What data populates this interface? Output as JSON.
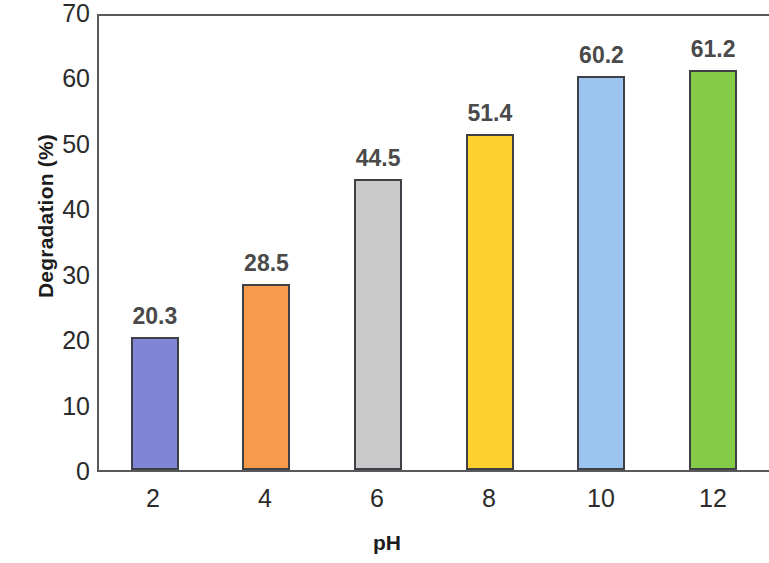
{
  "chart_data": {
    "type": "bar",
    "title": "",
    "xlabel": "pH",
    "ylabel": "Degradation (%)",
    "categories": [
      "2",
      "4",
      "6",
      "8",
      "10",
      "12"
    ],
    "values": [
      20.3,
      28.5,
      44.5,
      51.4,
      60.2,
      61.2
    ],
    "value_labels": [
      "20.3",
      "28.5",
      "44.5",
      "51.4",
      "60.2",
      "61.2"
    ],
    "ylim": [
      0,
      70
    ],
    "ytick_labels": [
      "0",
      "10",
      "20",
      "30",
      "40",
      "50",
      "60",
      "70"
    ],
    "ytick_values": [
      0,
      10,
      20,
      30,
      40,
      50,
      60,
      70
    ],
    "grid": false,
    "legend": "none",
    "bar_colors": [
      "#8185D6",
      "#F69B4C",
      "#C9C9C9",
      "#FFD12E",
      "#9CC4F0",
      "#84CC47"
    ],
    "bar_outline_color": "#3F3F46",
    "axis_color": "#58595B",
    "label_color": "#4A4A4A"
  }
}
